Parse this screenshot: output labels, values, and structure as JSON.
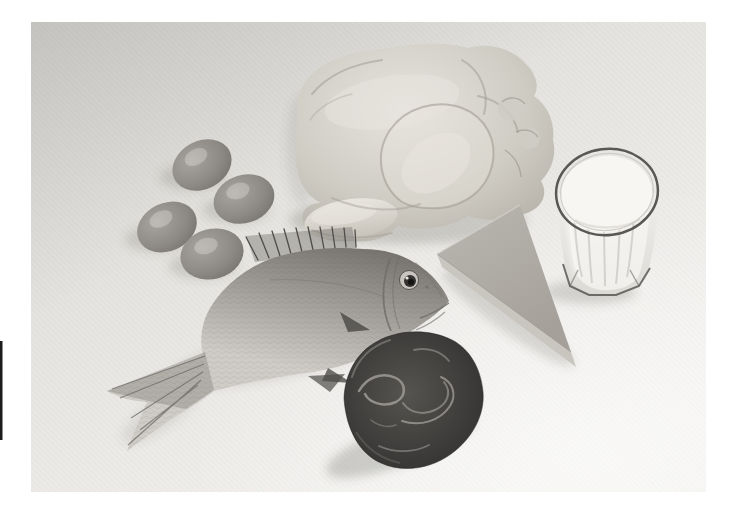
{
  "scene": {
    "type": "photograph",
    "style": "black-and-white halftone print",
    "description": "Black-and-white photograph of protein-rich foods: four eggs, a whole raw chicken, a glass of milk, a wedge of cheese, a whole fish and a piece of red meat arranged on a pale surface",
    "items": [
      {
        "id": "eggs",
        "label": "Four eggs",
        "count": 4
      },
      {
        "id": "whole-chicken",
        "label": "Whole raw chicken"
      },
      {
        "id": "glass-of-milk",
        "label": "Glass of milk"
      },
      {
        "id": "cheese-wedge",
        "label": "Wedge of cheese"
      },
      {
        "id": "fish",
        "label": "Whole fish"
      },
      {
        "id": "meat",
        "label": "Piece of red meat"
      }
    ]
  },
  "palette": {
    "page_bg": "#ffffff",
    "photo_top": "#d7d5d1",
    "photo_mid": "#e6e4e0",
    "photo_bottom": "#f4f3f1",
    "egg_light": "#a8a49f",
    "egg_mid": "#8d8985",
    "egg_dark": "#6e6b67",
    "chicken_light": "#e7e4de",
    "chicken_mid": "#cfccc4",
    "chicken_dark": "#aeaaa1",
    "chicken_line": "#a19d93",
    "drumstick_light": "#e9e6e0",
    "drumstick_dark": "#c6c2b9",
    "milk": "#f7f6f3",
    "glass_body_top": "#efedea",
    "glass_body_bottom": "#dcdad5",
    "glass_line": "#5a5855",
    "glass_streak": "#c7c5c0",
    "cheese_top_light": "#bab7b1",
    "cheese_top_dark": "#a5a19a",
    "cheese_side": "#c9c6c0",
    "cheese_edge": "#8f8c86",
    "fish_back": "#787571",
    "fish_mid": "#a6a39e",
    "fish_belly": "#cfccc7",
    "fish_dark": "#4f4d4a",
    "fish_line": "#6e6b67",
    "meat_edge": "#2e2c2a",
    "meat_dark": "#403e3c",
    "meat_mid": "#565450",
    "meat_marble": "#9a9792",
    "shadow": "#55534f",
    "artifact": "#1c1c1c"
  }
}
